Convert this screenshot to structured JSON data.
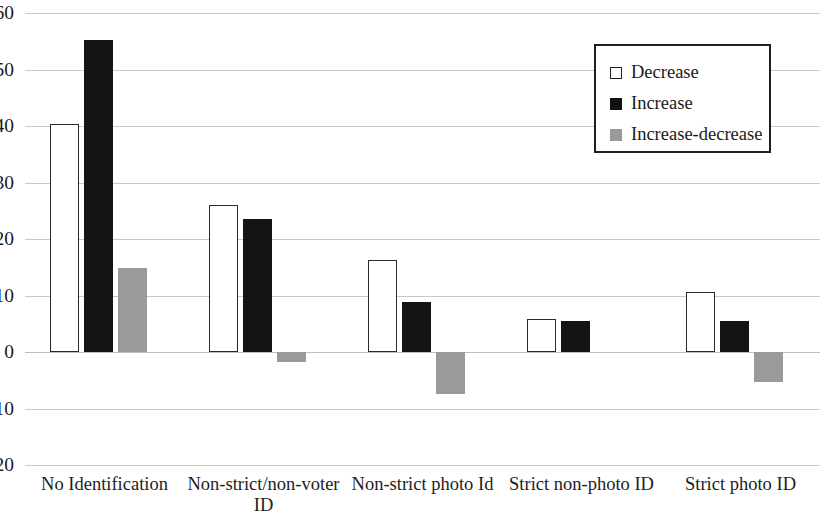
{
  "chart_data": {
    "type": "bar",
    "title": "",
    "subtitle": "",
    "xlabel": "",
    "ylabel": "",
    "ylim": [
      -20,
      60
    ],
    "ytick_step": 10,
    "yticks": [
      60,
      50,
      40,
      30,
      20,
      10,
      0,
      -10,
      -20
    ],
    "ytick_labels": [
      "60",
      "50",
      "40",
      "30",
      "20",
      "10",
      "0",
      "-10",
      "-20"
    ],
    "grid": true,
    "grid_axis": "y",
    "legend_position": "top-right",
    "categories": [
      "No Identification",
      "Non-strict/non-voter\nID",
      "Non-strict photo Id",
      "Strict non-photo ID",
      "Strict photo ID"
    ],
    "series": [
      {
        "name": "Decrease",
        "color": "#ffffff",
        "edge_color": "#2a2a2a",
        "values": [
          40.3,
          26.0,
          16.2,
          5.8,
          10.7
        ]
      },
      {
        "name": "Increase",
        "color": "#141414",
        "edge_color": "#141414",
        "values": [
          55.3,
          23.5,
          8.8,
          5.5,
          5.5
        ]
      },
      {
        "name": "Increase-decrease",
        "color": "#9a9a9a",
        "edge_color": "#9a9a9a",
        "values": [
          14.9,
          -1.8,
          -7.4,
          0.0,
          -5.3
        ]
      }
    ]
  },
  "legend": {
    "items": [
      {
        "label": "Decrease",
        "swatch": "open-square-swatch"
      },
      {
        "label": "Increase",
        "swatch": "filled-black-square-swatch"
      },
      {
        "label": "Increase-decrease",
        "swatch": "filled-gray-square-swatch"
      }
    ]
  },
  "axis": {
    "y_labels": [
      "60",
      "50",
      "40",
      "30",
      "20",
      "10",
      "0",
      "-10",
      "-20"
    ],
    "x_labels": [
      "No Identification",
      "Non-strict/non-voter\nID",
      "Non-strict photo Id",
      "Strict non-photo ID",
      "Strict photo ID"
    ]
  }
}
